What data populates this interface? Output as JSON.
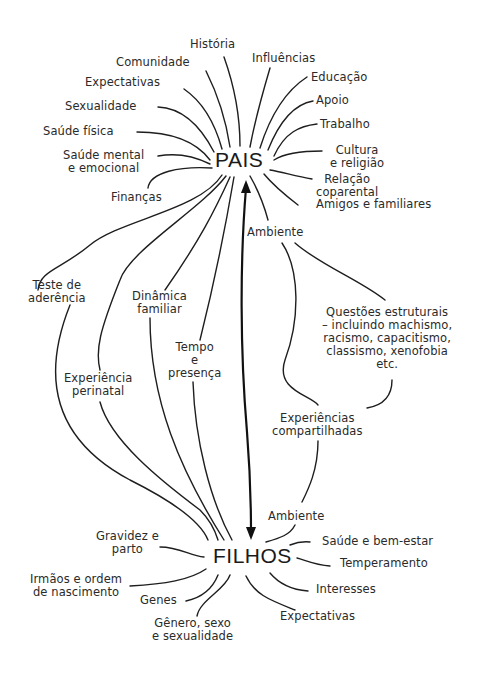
{
  "diagram": {
    "hubs": {
      "top": "PAIS",
      "bottom": "FILHOS"
    },
    "parent_factors": [
      {
        "id": "historia",
        "label": "História"
      },
      {
        "id": "comunidade",
        "label": "Comunidade"
      },
      {
        "id": "influencias",
        "label": "Influências"
      },
      {
        "id": "expectativas",
        "label": "Expectativas"
      },
      {
        "id": "educacao",
        "label": "Educação"
      },
      {
        "id": "sexualidade",
        "label": "Sexualidade"
      },
      {
        "id": "apoio",
        "label": "Apoio"
      },
      {
        "id": "trabalho",
        "label": "Trabalho"
      },
      {
        "id": "saude-fisica",
        "label": "Saúde física"
      },
      {
        "id": "saude-mental",
        "label": "Saúde mental\ne emocional"
      },
      {
        "id": "cultura",
        "label": "Cultura\ne religião"
      },
      {
        "id": "financas",
        "label": "Finanças"
      },
      {
        "id": "relacao",
        "label": "Relação\ncoparental"
      },
      {
        "id": "amigos",
        "label": "Amigos e familiares"
      },
      {
        "id": "ambiente-pais",
        "label": "Ambiente"
      }
    ],
    "shared_factors": [
      {
        "id": "teste",
        "label": "Teste de\naderência"
      },
      {
        "id": "dinamica",
        "label": "Dinâmica\nfamiliar"
      },
      {
        "id": "tempo",
        "label": "Tempo\ne\npresença"
      },
      {
        "id": "perinatal",
        "label": "Experiência\nperinatal"
      },
      {
        "id": "questoes",
        "label": "Questões estruturais\n– incluindo machismo,\nracismo, capacitismo,\nclassismo, xenofobia\netc."
      },
      {
        "id": "compartilhadas",
        "label": "Experiências\ncompartilhadas"
      }
    ],
    "child_factors": [
      {
        "id": "ambiente-filhos",
        "label": "Ambiente"
      },
      {
        "id": "gravidez",
        "label": "Gravidez e\nparto"
      },
      {
        "id": "saude-bem-estar",
        "label": "Saúde e bem-estar"
      },
      {
        "id": "temperamento",
        "label": "Temperamento"
      },
      {
        "id": "irmaos",
        "label": "Irmãos e ordem\nde nascimento"
      },
      {
        "id": "interesses",
        "label": "Interesses"
      },
      {
        "id": "genes",
        "label": "Genes"
      },
      {
        "id": "expectativas-filhos",
        "label": "Expectativas"
      },
      {
        "id": "genero",
        "label": "Gênero, sexo\ne sexualidade"
      }
    ],
    "colors": {
      "ink": "#1e1e1e",
      "background": "#ffffff"
    }
  }
}
